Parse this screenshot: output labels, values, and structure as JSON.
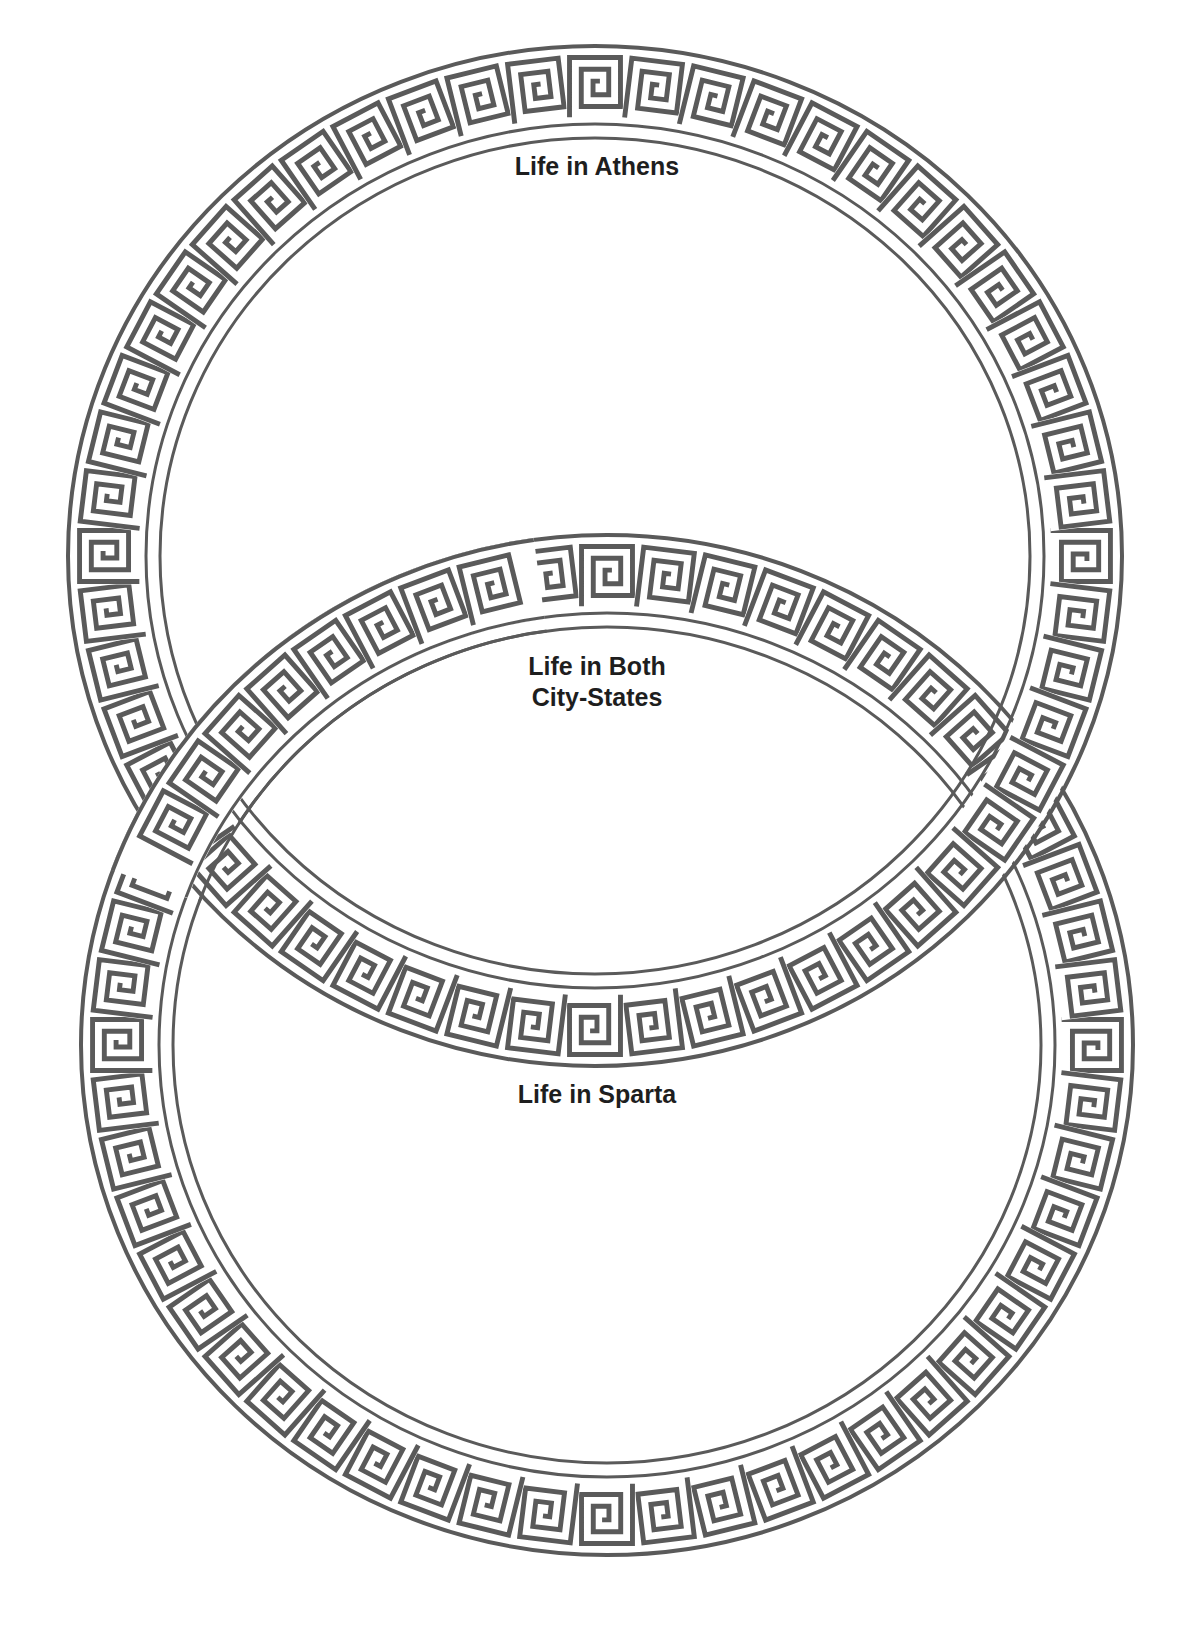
{
  "diagram": {
    "type": "venn-diagram",
    "style": "greek-key border rings",
    "colors": {
      "ink": "#5a5a5a",
      "background": "#ffffff",
      "text": "#1e1e1e"
    },
    "circles": [
      {
        "id": "athens",
        "label": "Life in Athens"
      },
      {
        "id": "sparta",
        "label": "Life in Sparta"
      }
    ],
    "overlap": {
      "label": "Life in Both\nCity-States"
    }
  }
}
